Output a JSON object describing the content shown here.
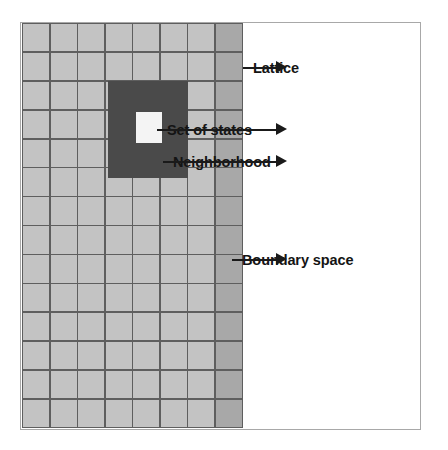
{
  "figure": {
    "type": "diagram",
    "colors": {
      "lattice_cell": "#c3c3c3",
      "boundary_cell": "#a8a8a8",
      "neighborhood": "#4a4a4a",
      "set_of_states": "#f4f4f4",
      "grid_line": "#5e5e5e",
      "label_text": "#141414",
      "arrow": "#1a1a1a",
      "frame": "#a8a8a8",
      "background": "#ffffff"
    }
  },
  "grid": {
    "columns": 8,
    "rows": 14,
    "boundary_column_index": 7,
    "neighborhood": {
      "cols": 3,
      "rows": 3,
      "start_col": 3,
      "start_row": 2
    },
    "set_of_states": {
      "col": 4,
      "row": 3
    }
  },
  "annotations": [
    {
      "id": "lattice",
      "label": "Lattice",
      "arrow": "arrow-right-icon"
    },
    {
      "id": "set_of_states",
      "label": "Set of states",
      "arrow": "arrow-right-icon"
    },
    {
      "id": "neighborhood",
      "label": "Neighborhood",
      "arrow": "arrow-right-icon"
    },
    {
      "id": "boundary",
      "label": "Boundary space",
      "arrow": "arrow-right-icon"
    }
  ]
}
